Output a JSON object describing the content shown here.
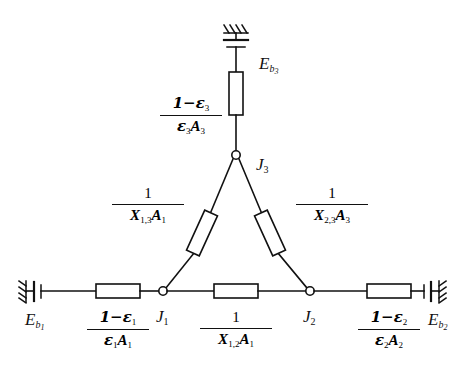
{
  "figure": {
    "kind": "radiation-network-diagram",
    "title_strip": "",
    "stroke_color": "#111111",
    "background_color": "#ffffff"
  },
  "nodes": {
    "j1": {
      "label": "J",
      "sub": "1",
      "x": 163,
      "y": 291
    },
    "j2": {
      "label": "J",
      "sub": "2",
      "x": 310,
      "y": 291
    },
    "j3": {
      "label": "J",
      "sub": "3",
      "x": 236,
      "y": 155
    }
  },
  "sources": {
    "eb1": {
      "symbol": "E",
      "sub": "b",
      "subsub": "1"
    },
    "eb2": {
      "symbol": "E",
      "sub": "b",
      "subsub": "2"
    },
    "eb3": {
      "symbol": "E",
      "sub": "b",
      "subsub": "3"
    }
  },
  "resistances": {
    "surface_1": {
      "num": "1−ε",
      "num_sub": "1",
      "den_eps": "ε",
      "den_eps_sub": "1",
      "den_area": "A",
      "den_area_sub": "1"
    },
    "surface_2": {
      "num": "1−ε",
      "num_sub": "2",
      "den_eps": "ε",
      "den_eps_sub": "2",
      "den_area": "A",
      "den_area_sub": "2"
    },
    "surface_3": {
      "num": "1−ε",
      "num_sub": "3",
      "den_eps": "ε",
      "den_eps_sub": "3",
      "den_area": "A",
      "den_area_sub": "3"
    },
    "space_12": {
      "num": "1",
      "den_x": "X",
      "den_x_sub": "1,2",
      "den_area": "A",
      "den_area_sub": "1"
    },
    "space_13": {
      "num": "1",
      "den_x": "X",
      "den_x_sub": "1,3",
      "den_area": "A",
      "den_area_sub": "1"
    },
    "space_23": {
      "num": "1",
      "den_x": "X",
      "den_x_sub": "2,3",
      "den_area": "A",
      "den_area_sub": "3"
    }
  }
}
